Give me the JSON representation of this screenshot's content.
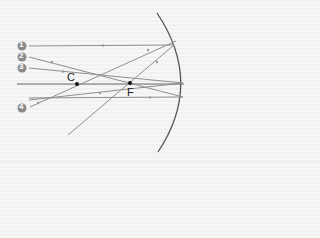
{
  "diagram": {
    "points": [
      {
        "label": "C",
        "x": 77,
        "y": 84
      },
      {
        "label": "F",
        "x": 130,
        "y": 83
      }
    ],
    "rays": [
      {
        "label": "1"
      },
      {
        "label": "2"
      },
      {
        "label": "3"
      },
      {
        "label": "4"
      }
    ],
    "colors": {
      "ray": "#8f8f8f",
      "mirror": "#555555",
      "axis": "#666666",
      "badge": "#8a8a8a"
    }
  }
}
